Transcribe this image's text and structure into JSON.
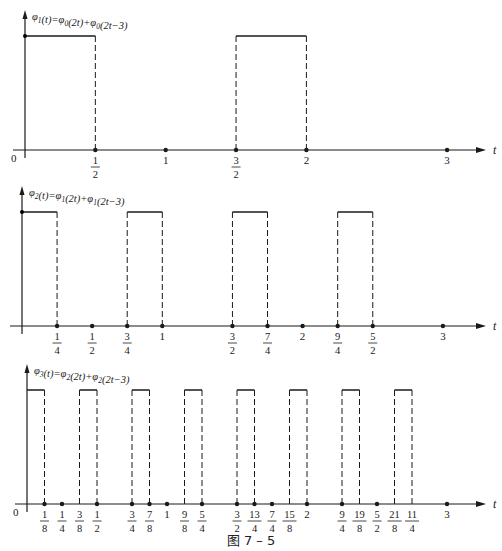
{
  "caption": "图 7 – 5",
  "chart_data": [
    {
      "type": "line",
      "title": "φ1(t)=φ0(2t)+φ0(2t−3)",
      "title_parts": {
        "lhs": "φ",
        "lhs_sub": "1",
        "rest": "(t)=φ",
        "a_sub": "0",
        "mid": "(2t)+φ",
        "b_sub": "0",
        "end": "(2t−3)"
      },
      "xlabel": "t",
      "ylabel": "",
      "xlim": [
        0,
        3.2
      ],
      "ylim": [
        0,
        1
      ],
      "grid": false,
      "pulses": [
        [
          0,
          0.5
        ],
        [
          1.5,
          2
        ]
      ],
      "ticks": [
        {
          "value": 0.5,
          "num": "1",
          "den": "2",
          "dot": true
        },
        {
          "value": 1,
          "label": "1",
          "dot": true
        },
        {
          "value": 1.5,
          "num": "3",
          "den": "2",
          "dot": true
        },
        {
          "value": 2,
          "label": "2",
          "dot": true
        },
        {
          "value": 3,
          "label": "3",
          "dot": true
        }
      ],
      "origin_label": "0",
      "layout": {
        "axis_y": 150,
        "origin_x": 25,
        "scale": 140.7,
        "top_y": 36,
        "yaxis_top": 12
      }
    },
    {
      "type": "line",
      "title": "φ2(t)=φ1(2t)+φ1(2t−3)",
      "title_parts": {
        "lhs": "φ",
        "lhs_sub": "2",
        "rest": "(t)=φ",
        "a_sub": "1",
        "mid": "(2t)+φ",
        "b_sub": "1",
        "end": "(2t−3)"
      },
      "xlabel": "t",
      "ylabel": "",
      "xlim": [
        0,
        3.2
      ],
      "ylim": [
        0,
        1
      ],
      "grid": false,
      "pulses": [
        [
          0,
          0.25
        ],
        [
          0.75,
          1
        ],
        [
          1.5,
          1.75
        ],
        [
          2.25,
          2.5
        ]
      ],
      "ticks": [
        {
          "value": 0.25,
          "num": "1",
          "den": "4",
          "dot": true
        },
        {
          "value": 0.5,
          "num": "1",
          "den": "2",
          "dot": true
        },
        {
          "value": 0.75,
          "num": "3",
          "den": "4",
          "dot": true
        },
        {
          "value": 1,
          "label": "1",
          "dot": true
        },
        {
          "value": 1.5,
          "num": "3",
          "den": "2",
          "dot": true
        },
        {
          "value": 1.75,
          "num": "7",
          "den": "4",
          "dot": true
        },
        {
          "value": 2,
          "label": "2",
          "dot": true
        },
        {
          "value": 2.25,
          "num": "9",
          "den": "4",
          "dot": true
        },
        {
          "value": 2.5,
          "num": "5",
          "den": "2",
          "dot": true
        },
        {
          "value": 3,
          "label": "3",
          "dot": true
        }
      ],
      "origin_label": "",
      "layout": {
        "axis_y": 326,
        "origin_x": 22,
        "scale": 140.3,
        "top_y": 212,
        "yaxis_top": 188
      }
    },
    {
      "type": "line",
      "title": "φ3(t)=φ2(2t)+φ2(2t−3)",
      "title_parts": {
        "lhs": "φ",
        "lhs_sub": "3",
        "rest": "(t)=φ",
        "a_sub": "2",
        "mid": "(2t)+φ",
        "b_sub": "2",
        "end": "(2t−3)"
      },
      "xlabel": "t",
      "ylabel": "",
      "xlim": [
        0,
        3.2
      ],
      "ylim": [
        0,
        1
      ],
      "grid": false,
      "pulses": [
        [
          0,
          0.125
        ],
        [
          0.375,
          0.5
        ],
        [
          0.75,
          0.875
        ],
        [
          1.125,
          1.25
        ],
        [
          1.5,
          1.625
        ],
        [
          1.875,
          2
        ],
        [
          2.25,
          2.375
        ],
        [
          2.625,
          2.75
        ]
      ],
      "ticks": [
        {
          "value": 0.125,
          "num": "1",
          "den": "8",
          "dot": true
        },
        {
          "value": 0.25,
          "num": "1",
          "den": "4",
          "dot": true
        },
        {
          "value": 0.375,
          "num": "3",
          "den": "8",
          "dot": false
        },
        {
          "value": 0.5,
          "num": "1",
          "den": "2",
          "dot": true
        },
        {
          "value": 0.75,
          "num": "3",
          "den": "4",
          "dot": true
        },
        {
          "value": 0.875,
          "num": "7",
          "den": "8",
          "dot": true
        },
        {
          "value": 1,
          "label": "1",
          "dot": true
        },
        {
          "value": 1.125,
          "num": "9",
          "den": "8",
          "dot": false
        },
        {
          "value": 1.25,
          "num": "5",
          "den": "4",
          "dot": true
        },
        {
          "value": 1.5,
          "num": "3",
          "den": "2",
          "dot": true
        },
        {
          "value": 1.625,
          "num": "13",
          "den": "4",
          "dot": true
        },
        {
          "value": 1.75,
          "num": "7",
          "den": "4",
          "dot": true
        },
        {
          "value": 1.875,
          "num": "15",
          "den": "8",
          "dot": false
        },
        {
          "value": 2,
          "label": "2",
          "dot": true
        },
        {
          "value": 2.25,
          "num": "9",
          "den": "4",
          "dot": true
        },
        {
          "value": 2.375,
          "num": "19",
          "den": "8",
          "dot": false
        },
        {
          "value": 2.5,
          "num": "5",
          "den": "2",
          "dot": true
        },
        {
          "value": 2.625,
          "num": "21",
          "den": "8",
          "dot": false
        },
        {
          "value": 2.75,
          "num": "11",
          "den": "4",
          "dot": false
        },
        {
          "value": 3,
          "label": "3",
          "dot": true
        }
      ],
      "origin_label": "0",
      "layout": {
        "axis_y": 504,
        "origin_x": 27,
        "scale": 140,
        "top_y": 390,
        "yaxis_top": 366
      }
    }
  ]
}
